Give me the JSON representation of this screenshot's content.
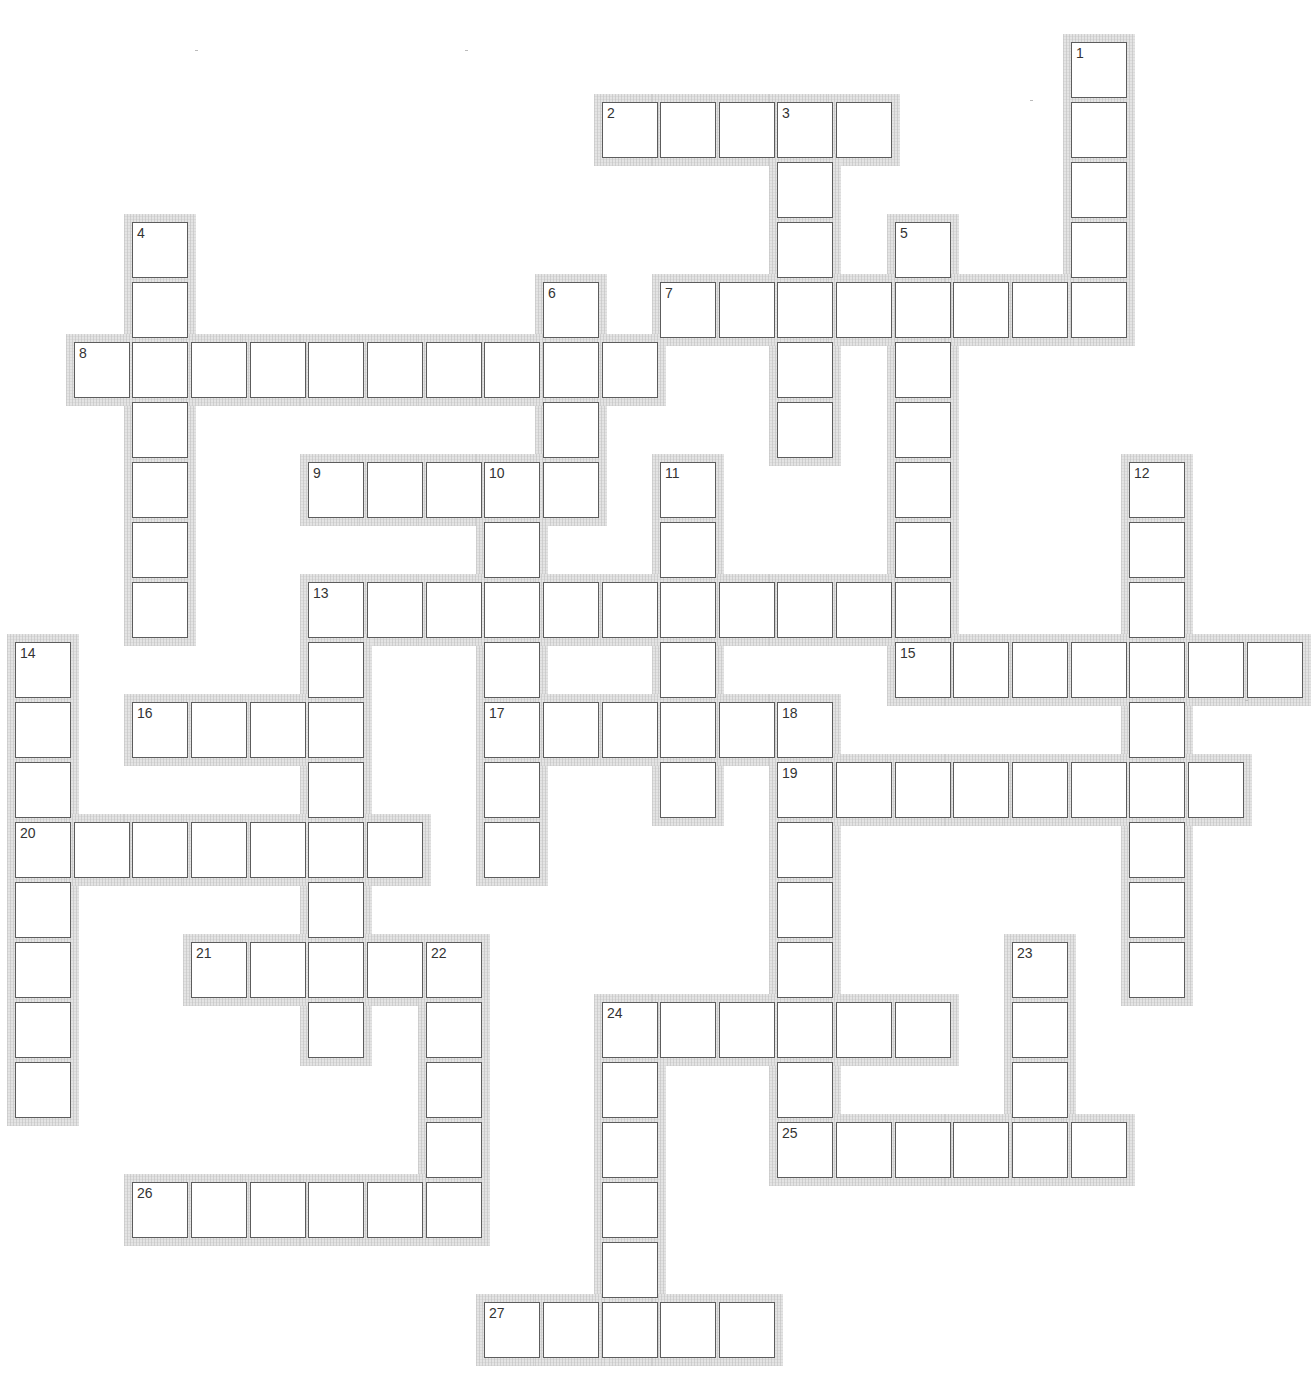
{
  "puzzle": {
    "type": "crossword",
    "grid": {
      "origin_x": 15,
      "origin_y": 42,
      "col_pitch": 58.65,
      "row_pitch": 60,
      "cell_size": 56,
      "cols": 22,
      "rows": 22
    },
    "colors": {
      "cell_border": "#5c5c5c",
      "cell_fill": "#ffffff",
      "frame": "#d8d8d8",
      "number": "#333333",
      "background": "#ffffff"
    },
    "words": [
      {
        "number": "1",
        "direction": "down",
        "row": 0,
        "col": 18,
        "length": 5
      },
      {
        "number": "2",
        "direction": "across",
        "row": 1,
        "col": 10,
        "length": 5
      },
      {
        "number": "3",
        "direction": "down",
        "row": 1,
        "col": 13,
        "length": 6
      },
      {
        "number": "4",
        "direction": "down",
        "row": 3,
        "col": 2,
        "length": 7
      },
      {
        "number": "5",
        "direction": "down",
        "row": 3,
        "col": 15,
        "length": 8
      },
      {
        "number": "6",
        "direction": "down",
        "row": 4,
        "col": 9,
        "length": 4
      },
      {
        "number": "7",
        "direction": "across",
        "row": 4,
        "col": 11,
        "length": 8
      },
      {
        "number": "8",
        "direction": "across",
        "row": 5,
        "col": 1,
        "length": 10
      },
      {
        "number": "9",
        "direction": "across",
        "row": 7,
        "col": 5,
        "length": 5
      },
      {
        "number": "10",
        "direction": "down",
        "row": 7,
        "col": 8,
        "length": 7
      },
      {
        "number": "11",
        "direction": "down",
        "row": 7,
        "col": 11,
        "length": 6
      },
      {
        "number": "12",
        "direction": "down",
        "row": 7,
        "col": 19,
        "length": 9
      },
      {
        "number": "13",
        "direction": "across",
        "row": 9,
        "col": 5,
        "length": 11
      },
      {
        "number": "13",
        "direction": "down",
        "row": 9,
        "col": 5,
        "length": 8
      },
      {
        "number": "14",
        "direction": "down",
        "row": 10,
        "col": 0,
        "length": 8
      },
      {
        "number": "15",
        "direction": "across",
        "row": 10,
        "col": 15,
        "length": 7
      },
      {
        "number": "16",
        "direction": "across",
        "row": 11,
        "col": 2,
        "length": 4
      },
      {
        "number": "17",
        "direction": "across",
        "row": 11,
        "col": 8,
        "length": 6
      },
      {
        "number": "18",
        "direction": "down",
        "row": 11,
        "col": 13,
        "length": 8
      },
      {
        "number": "19",
        "direction": "across",
        "row": 12,
        "col": 13,
        "length": 8
      },
      {
        "number": "20",
        "direction": "across",
        "row": 13,
        "col": 0,
        "length": 7
      },
      {
        "number": "21",
        "direction": "across",
        "row": 15,
        "col": 3,
        "length": 5
      },
      {
        "number": "22",
        "direction": "down",
        "row": 15,
        "col": 7,
        "length": 5
      },
      {
        "number": "23",
        "direction": "down",
        "row": 15,
        "col": 17,
        "length": 4
      },
      {
        "number": "24",
        "direction": "across",
        "row": 16,
        "col": 10,
        "length": 6
      },
      {
        "number": "24",
        "direction": "down",
        "row": 16,
        "col": 10,
        "length": 6
      },
      {
        "number": "25",
        "direction": "across",
        "row": 18,
        "col": 13,
        "length": 6
      },
      {
        "number": "26",
        "direction": "across",
        "row": 19,
        "col": 2,
        "length": 6
      },
      {
        "number": "27",
        "direction": "across",
        "row": 21,
        "col": 8,
        "length": 5
      }
    ],
    "entries": {}
  }
}
